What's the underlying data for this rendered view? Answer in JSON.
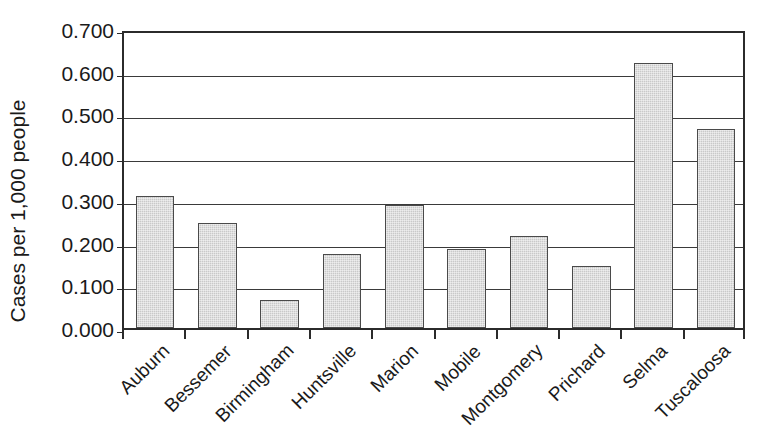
{
  "chart_data": {
    "type": "bar",
    "title": "",
    "subtitle": "",
    "xlabel": "",
    "ylabel": "Cases per 1,000 people",
    "ylim": [
      0.0,
      0.7
    ],
    "ytick_labels": [
      "0.700",
      "0.600",
      "0.500",
      "0.400",
      "0.300",
      "0.200",
      "0.100",
      "0.000"
    ],
    "ytick_values": [
      0.7,
      0.6,
      0.5,
      0.4,
      0.3,
      0.2,
      0.1,
      0.0
    ],
    "grid": "horizontal",
    "legend": "none",
    "bar_color": "#c9c9c9",
    "bar_border_color": "#4a4a4a",
    "axis_color": "#2b2b2b",
    "categories": [
      "Auburn",
      "Bessemer",
      "Birmingham",
      "Huntsville",
      "Marion",
      "Mobile",
      "Montgomery",
      "Prichard",
      "Selma",
      "Tuscaloosa"
    ],
    "values": [
      0.308,
      0.245,
      0.065,
      0.173,
      0.287,
      0.185,
      0.215,
      0.145,
      0.62,
      0.465
    ],
    "annotations": []
  }
}
